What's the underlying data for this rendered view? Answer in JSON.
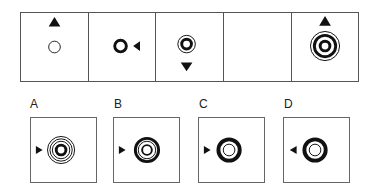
{
  "puzzle": {
    "sequence": [
      {
        "index": 1,
        "shape": "single-thin-ring",
        "arrow": "up",
        "arrow_position": "above"
      },
      {
        "index": 2,
        "shape": "single-thick-ring",
        "arrow": "left",
        "arrow_position": "right"
      },
      {
        "index": 3,
        "shape": "thick-ring-with-thin-outer-ring",
        "arrow": "down",
        "arrow_position": "below"
      },
      {
        "index": 4,
        "shape": "blank",
        "arrow": null,
        "arrow_position": null
      },
      {
        "index": 5,
        "shape": "thick-ring-with-thick-and-thin-outer-rings",
        "arrow": "up",
        "arrow_position": "above"
      }
    ],
    "options": [
      {
        "label": "A",
        "shape": "thick-ring-with-triple-thin-outer-rings",
        "arrow": "right",
        "arrow_position": "left"
      },
      {
        "label": "B",
        "shape": "concentric-thick-and-thin-rings",
        "arrow": "right",
        "arrow_position": "left"
      },
      {
        "label": "C",
        "shape": "thick-ring-with-thin-ring-inside",
        "arrow": "right",
        "arrow_position": "left"
      },
      {
        "label": "D",
        "shape": "thick-ring-with-thin-ring-inside",
        "arrow": "left",
        "arrow_position": "left"
      }
    ]
  },
  "colors": {
    "stroke": "#111111",
    "border": "#555555",
    "background": "#ffffff"
  }
}
